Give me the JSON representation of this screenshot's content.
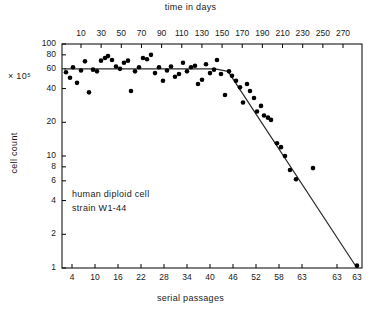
{
  "chart_data": {
    "type": "scatter",
    "title": "",
    "xlabel": "serial passages",
    "ylabel": "cell count",
    "y_multiplier": "× 10⁵",
    "top_axis_label": "time in days",
    "annotations": [
      "human diploid cell",
      "strain W1-44"
    ],
    "grid": false,
    "legend": null,
    "y_scale": "log",
    "ylim": [
      1,
      100
    ],
    "y_ticks": [
      1,
      2,
      4,
      6,
      8,
      10,
      20,
      40,
      60,
      80,
      100
    ],
    "y_tick_labels": [
      "1",
      "2",
      "4",
      "6",
      "8",
      "10",
      "20",
      "40",
      "60",
      "80",
      "100"
    ],
    "x_ticks": [
      "4",
      "10",
      "16",
      "22",
      "28",
      "34",
      "40",
      "46",
      "52",
      "58",
      "63",
      "63",
      "63"
    ],
    "top_ticks": [
      10,
      30,
      50,
      70,
      90,
      110,
      130,
      150,
      170,
      190,
      210,
      230,
      250,
      270
    ],
    "points": [
      [
        66,
        56
      ],
      [
        70,
        50
      ],
      [
        73,
        62
      ],
      [
        77,
        45
      ],
      [
        81,
        58
      ],
      [
        85,
        70
      ],
      [
        89,
        37
      ],
      [
        93,
        59
      ],
      [
        97,
        57
      ],
      [
        101,
        71
      ],
      [
        105,
        75
      ],
      [
        108,
        78
      ],
      [
        112,
        72
      ],
      [
        116,
        63
      ],
      [
        120,
        60
      ],
      [
        124,
        68
      ],
      [
        128,
        71
      ],
      [
        131,
        38
      ],
      [
        135,
        57
      ],
      [
        139,
        62
      ],
      [
        143,
        75
      ],
      [
        147,
        73
      ],
      [
        151,
        80
      ],
      [
        155,
        55
      ],
      [
        159,
        62
      ],
      [
        163,
        47
      ],
      [
        167,
        58
      ],
      [
        171,
        63
      ],
      [
        175,
        51
      ],
      [
        179,
        54
      ],
      [
        183,
        68
      ],
      [
        187,
        57
      ],
      [
        191,
        62
      ],
      [
        195,
        64
      ],
      [
        198,
        44
      ],
      [
        202,
        48
      ],
      [
        206,
        66
      ],
      [
        210,
        55
      ],
      [
        214,
        59
      ],
      [
        217,
        72
      ],
      [
        221,
        54
      ],
      [
        225,
        35
      ],
      [
        229,
        57
      ],
      [
        232,
        52
      ],
      [
        236,
        47
      ],
      [
        240,
        41
      ],
      [
        243,
        30
      ],
      [
        247,
        44
      ],
      [
        250,
        38
      ],
      [
        254,
        33
      ],
      [
        257,
        25
      ],
      [
        261,
        28
      ],
      [
        264,
        23
      ],
      [
        268,
        22
      ],
      [
        271,
        21
      ],
      [
        277,
        13
      ],
      [
        281,
        12
      ],
      [
        285,
        10
      ],
      [
        290,
        7.5
      ],
      [
        296,
        6.2
      ],
      [
        313,
        7.8
      ],
      [
        357,
        1.05
      ]
    ],
    "trend_line": {
      "description": "plateau then steep senescence decline",
      "vertices": [
        [
          64,
          60
        ],
        [
          215,
          60
        ],
        [
          228,
          57
        ],
        [
          357,
          1.0
        ]
      ]
    }
  },
  "axes": {
    "top_title": "time in days",
    "bottom_title": "serial passages",
    "left_title": "cell count",
    "multiplier": "× 10⁵"
  }
}
